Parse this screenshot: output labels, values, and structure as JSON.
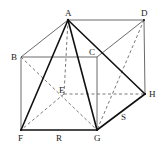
{
  "diagram": {
    "type": "geometry",
    "colors": {
      "line": "#333333",
      "thick": "#111111",
      "dashed": "#555555"
    },
    "points": {
      "A": [
        68,
        20
      ],
      "D": [
        144,
        20
      ],
      "B": [
        21,
        57
      ],
      "C": [
        97,
        57
      ],
      "E": [
        64,
        94
      ],
      "H": [
        145,
        94
      ],
      "F": [
        21,
        130
      ],
      "G": [
        97,
        130
      ]
    },
    "labels": {
      "A": "A",
      "B": "B",
      "C": "C",
      "D": "D",
      "E": "E",
      "F": "F",
      "G": "G",
      "H": "H",
      "R": "R",
      "S": "S"
    },
    "solid_edges": [
      [
        "A",
        "D"
      ],
      [
        "A",
        "B"
      ],
      [
        "B",
        "C"
      ],
      [
        "C",
        "D"
      ],
      [
        "B",
        "F"
      ],
      [
        "C",
        "G"
      ],
      [
        "D",
        "H"
      ]
    ],
    "thick_edges": [
      [
        "A",
        "F"
      ],
      [
        "A",
        "G"
      ],
      [
        "A",
        "H"
      ],
      [
        "F",
        "G"
      ],
      [
        "G",
        "H"
      ]
    ],
    "dashed_edges": [
      [
        "A",
        "E"
      ],
      [
        "E",
        "H"
      ],
      [
        "E",
        "F"
      ],
      [
        "B",
        "G"
      ],
      [
        "D",
        "G"
      ]
    ]
  }
}
